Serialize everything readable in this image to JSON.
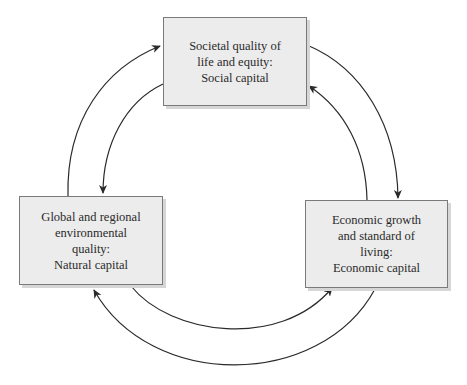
{
  "diagram": {
    "type": "cycle",
    "nodes": [
      {
        "id": "social",
        "lines": [
          "Societal quality of",
          "life and equity:",
          "Social capital"
        ]
      },
      {
        "id": "natural",
        "lines": [
          "Global and regional",
          "environmental",
          "quality:",
          "Natural capital"
        ]
      },
      {
        "id": "economic",
        "lines": [
          "Economic growth",
          "and standard of",
          "living:",
          "Economic capital"
        ]
      }
    ],
    "edges": [
      {
        "from": "natural",
        "to": "social"
      },
      {
        "from": "social",
        "to": "natural"
      },
      {
        "from": "social",
        "to": "economic"
      },
      {
        "from": "economic",
        "to": "social"
      },
      {
        "from": "natural",
        "to": "economic"
      },
      {
        "from": "economic",
        "to": "natural"
      }
    ],
    "colors": {
      "box_fill": "#ececec",
      "box_border": "#7a7a7a",
      "arrow": "#2a2a2a",
      "text": "#2a2a2a"
    }
  }
}
